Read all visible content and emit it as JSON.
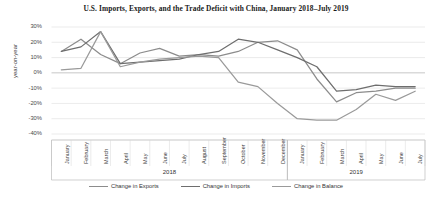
{
  "chart_data": {
    "type": "line",
    "title": "U.S. Imports, Exports, and the Trade Deficit with China, January 2018–July 2019",
    "xlabel": "",
    "ylabel": "year-on-year",
    "ylim": [
      -40,
      30
    ],
    "ytick_labels": [
      "30%",
      "20%",
      "10%",
      "0%",
      "-10%",
      "-20%",
      "-30%",
      "-40%"
    ],
    "ytick_values": [
      30,
      20,
      10,
      0,
      -10,
      -20,
      -30,
      -40
    ],
    "grid": true,
    "legend_position": "bottom",
    "categories": [
      "January",
      "February",
      "March",
      "April",
      "May",
      "June",
      "July",
      "August",
      "September",
      "October",
      "November",
      "December",
      "January",
      "February",
      "March",
      "April",
      "May",
      "June",
      "July"
    ],
    "year_groups": [
      {
        "label": "2018",
        "start_index": 0,
        "end_index": 11
      },
      {
        "label": "2019",
        "start_index": 12,
        "end_index": 18
      }
    ],
    "series": [
      {
        "name": "Change in Exports",
        "color": "#8c8c8c",
        "values": [
          14,
          22,
          12,
          6,
          13,
          16,
          11,
          12,
          11,
          14,
          20,
          21,
          15,
          -4,
          -19,
          -13,
          -12,
          -10,
          -10
        ]
      },
      {
        "name": "Change in Imports",
        "color": "#6e6e6e",
        "values": [
          14,
          17,
          27,
          6,
          7,
          8,
          9,
          12,
          14,
          22,
          20,
          15,
          10,
          4,
          -12,
          -11,
          -8,
          -9,
          -9
        ]
      },
      {
        "name": "Change in Balance",
        "color": "#9a9a9a",
        "values": [
          2,
          3,
          27,
          4,
          7,
          9,
          10,
          11,
          10,
          -6,
          -9,
          -20,
          -30,
          -31,
          -31,
          -24,
          -14,
          -18,
          -12
        ]
      }
    ]
  }
}
